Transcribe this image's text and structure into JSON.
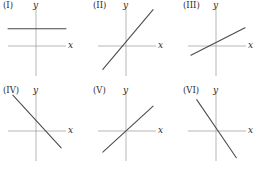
{
  "figure": {
    "background_color": "#ffffff",
    "axis_color": "#9a9a9a",
    "line_color": "#4a4a4a",
    "label_color": "#2b2b2b",
    "columns": 3,
    "rows": 2
  },
  "chart_data": {
    "type": "line",
    "title": "",
    "xlabel": "x",
    "ylabel": "y",
    "grid": false,
    "legend": "none",
    "panels": [
      {
        "id": "I",
        "label": "(I)",
        "xlabel": "x",
        "ylabel": "y",
        "slope": 0,
        "intercept": 0.55,
        "slope_sign": "zero",
        "x_range": [
          -1.6,
          1.4
        ],
        "y_range": [
          -1.6,
          1.5
        ],
        "line_x": [
          -1.6,
          1.4
        ],
        "line_y": [
          0.55,
          0.55
        ]
      },
      {
        "id": "II",
        "label": "(II)",
        "xlabel": "x",
        "ylabel": "y",
        "slope": 1.05,
        "intercept": 0.12,
        "slope_sign": "positive",
        "x_range": [
          -1.6,
          1.4
        ],
        "y_range": [
          -1.6,
          1.5
        ],
        "line_x": [
          -1.35,
          1.25
        ],
        "line_y": [
          -1.3,
          1.43
        ]
      },
      {
        "id": "III",
        "label": "(III)",
        "xlabel": "x",
        "ylabel": "y",
        "slope": 0.45,
        "intercept": 0.0,
        "slope_sign": "positive",
        "x_range": [
          -1.6,
          1.4
        ],
        "y_range": [
          -1.6,
          1.5
        ],
        "line_x": [
          -1.45,
          1.35
        ],
        "line_y": [
          -0.65,
          0.6
        ]
      },
      {
        "id": "IV",
        "label": "(IV)",
        "xlabel": "x",
        "ylabel": "y",
        "slope": -0.95,
        "intercept": 0.25,
        "slope_sign": "negative",
        "x_range": [
          -1.6,
          1.4
        ],
        "y_range": [
          -1.6,
          1.5
        ],
        "line_x": [
          -1.35,
          1.15
        ],
        "line_y": [
          1.4,
          -1.0
        ]
      },
      {
        "id": "V",
        "label": "(V)",
        "xlabel": "x",
        "ylabel": "y",
        "slope": 0.78,
        "intercept": -0.12,
        "slope_sign": "positive",
        "x_range": [
          -1.6,
          1.4
        ],
        "y_range": [
          -1.6,
          1.5
        ],
        "line_x": [
          -1.35,
          1.25
        ],
        "line_y": [
          -1.2,
          0.9
        ]
      },
      {
        "id": "VI",
        "label": "(VI)",
        "xlabel": "x",
        "ylabel": "y",
        "slope": -1.3,
        "intercept": -0.25,
        "slope_sign": "negative",
        "x_range": [
          -1.6,
          1.4
        ],
        "y_range": [
          -1.6,
          1.5
        ],
        "line_x": [
          -1.15,
          0.9
        ],
        "line_y": [
          1.2,
          -1.45
        ]
      }
    ]
  }
}
